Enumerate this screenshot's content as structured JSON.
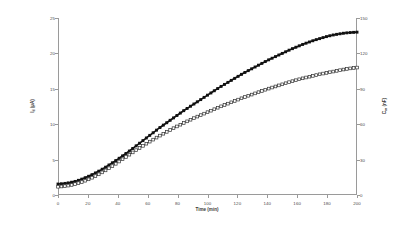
{
  "chart_data": {
    "type": "line",
    "title": "",
    "xlabel": "Time (min)",
    "ylabel": "I_d (µA)",
    "y2label": "C_m (nF)",
    "xlim": [
      0,
      200
    ],
    "ylim": [
      0,
      25
    ],
    "y2lim": [
      0,
      150
    ],
    "grid": false,
    "legend": "none",
    "xticks": [
      0,
      20,
      40,
      60,
      80,
      100,
      120,
      140,
      160,
      180,
      200
    ],
    "yticks": [
      0,
      5,
      10,
      15,
      20,
      25
    ],
    "y2ticks": [
      0,
      30,
      60,
      90,
      120,
      150
    ],
    "series": [
      {
        "name": "I_d (µA)",
        "axis": "left",
        "marker": "filled-square",
        "color": "#111111",
        "x": [
          0,
          4,
          8,
          12,
          16,
          20,
          24,
          28,
          32,
          36,
          40,
          44,
          48,
          52,
          56,
          60,
          64,
          68,
          72,
          76,
          80,
          84,
          88,
          92,
          96,
          100,
          104,
          108,
          112,
          116,
          120,
          124,
          128,
          132,
          136,
          140,
          144,
          148,
          152,
          156,
          160,
          164,
          168,
          172,
          176,
          180,
          184,
          188,
          192,
          196,
          200
        ],
        "values": [
          1.55,
          1.62,
          1.75,
          1.95,
          2.25,
          2.6,
          3.0,
          3.45,
          3.95,
          4.5,
          5.05,
          5.65,
          6.25,
          6.9,
          7.55,
          8.2,
          8.85,
          9.5,
          10.1,
          10.7,
          11.3,
          11.9,
          12.45,
          13.0,
          13.55,
          14.1,
          14.65,
          15.2,
          15.7,
          16.2,
          16.7,
          17.2,
          17.65,
          18.1,
          18.55,
          19.0,
          19.4,
          19.8,
          20.2,
          20.6,
          20.95,
          21.3,
          21.6,
          21.9,
          22.15,
          22.4,
          22.6,
          22.75,
          22.88,
          22.95,
          23.0
        ]
      },
      {
        "name": "C_m (nF)",
        "axis": "right",
        "marker": "open-square",
        "color": "#333333",
        "x": [
          0,
          4,
          8,
          12,
          16,
          20,
          24,
          28,
          32,
          36,
          40,
          44,
          48,
          52,
          56,
          60,
          64,
          68,
          72,
          76,
          80,
          84,
          88,
          92,
          96,
          100,
          104,
          108,
          112,
          116,
          120,
          124,
          128,
          132,
          136,
          140,
          144,
          148,
          152,
          156,
          160,
          164,
          168,
          172,
          176,
          180,
          184,
          188,
          192,
          196,
          200
        ],
        "values": [
          7.0,
          7.4,
          8.2,
          9.4,
          11.0,
          13.0,
          15.4,
          18.0,
          21.0,
          24.2,
          27.6,
          31.0,
          34.4,
          37.8,
          41.0,
          44.2,
          47.2,
          50.2,
          53.0,
          55.8,
          58.4,
          61.0,
          63.4,
          65.8,
          68.0,
          70.2,
          72.4,
          74.6,
          76.6,
          78.6,
          80.6,
          82.6,
          84.4,
          86.2,
          88.0,
          89.8,
          91.4,
          93.0,
          94.6,
          96.2,
          97.6,
          99.0,
          100.2,
          101.4,
          102.6,
          103.6,
          104.6,
          105.6,
          106.6,
          107.4,
          108.0
        ]
      }
    ]
  },
  "axes": {
    "x": {
      "title": "Time (min)",
      "ticks": [
        "0",
        "20",
        "40",
        "60",
        "80",
        "100",
        "120",
        "140",
        "160",
        "180",
        "200"
      ]
    },
    "y_left": {
      "title_main": "I",
      "title_sub": "d",
      "title_unit": " (µA)",
      "ticks": [
        "25",
        "20",
        "15",
        "10",
        "5",
        "0"
      ]
    },
    "y_right": {
      "title_main": "C",
      "title_sub": "m",
      "title_unit": " (nF)",
      "ticks": [
        "150",
        "120",
        "90",
        "60",
        "30",
        "0"
      ]
    }
  },
  "colors": {
    "axis": "#9a9a9a",
    "tick_text": "#4a4a4a",
    "series_filled": "#111111",
    "series_open_stroke": "#333333",
    "series_open_fill": "#ffffff",
    "background": "#ffffff"
  }
}
